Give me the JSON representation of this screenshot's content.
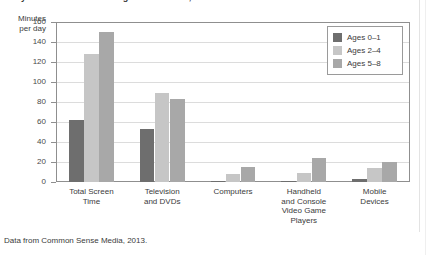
{
  "figure": {
    "title": "Daily Screen Time for Young U.S. Children, 2013",
    "source_note": "Data from Common Sense Media, 2013.",
    "axis_caption_line1": "Minutes",
    "axis_caption_line2": "per day"
  },
  "chart_data": {
    "type": "bar",
    "title": "Daily Screen Time for Young U.S. Children, 2013",
    "xlabel": "",
    "ylabel": "Minutes per day",
    "ylim": [
      0,
      160
    ],
    "ytick_labels": [
      "160",
      "140",
      "120",
      "100",
      "80",
      "60",
      "40",
      "20",
      "0"
    ],
    "ytick_values": [
      160,
      140,
      120,
      100,
      80,
      60,
      40,
      20,
      0
    ],
    "grid": true,
    "legend_position": "top-right",
    "categories": [
      "Total Screen Time",
      "Television and DVDs",
      "Computers",
      "Handheld and Console Video Game Players",
      "Mobile Devices"
    ],
    "category_label_lines": [
      [
        "Total Screen",
        "Time"
      ],
      [
        "Television",
        "and DVDs"
      ],
      [
        "Computers"
      ],
      [
        "Handheld",
        "and Console",
        "Video Game",
        "Players"
      ],
      [
        "Mobile",
        "Devices"
      ]
    ],
    "series": [
      {
        "name": "Ages 0–1",
        "color": "#6e6e6e",
        "values": [
          62,
          53,
          1,
          1,
          3
        ]
      },
      {
        "name": "Ages 2–4",
        "color": "#c6c6c6",
        "values": [
          128,
          89,
          8,
          9,
          14
        ]
      },
      {
        "name": "Ages 5–8",
        "color": "#a8a8a8",
        "values": [
          150,
          83,
          15,
          24,
          20
        ]
      }
    ]
  },
  "colors": {
    "axis": "#8f8f8f",
    "grid": "#dcdcdc",
    "text": "#3b3b3b",
    "series_0": "#6e6e6e",
    "series_1": "#c6c6c6",
    "series_2": "#a8a8a8"
  }
}
